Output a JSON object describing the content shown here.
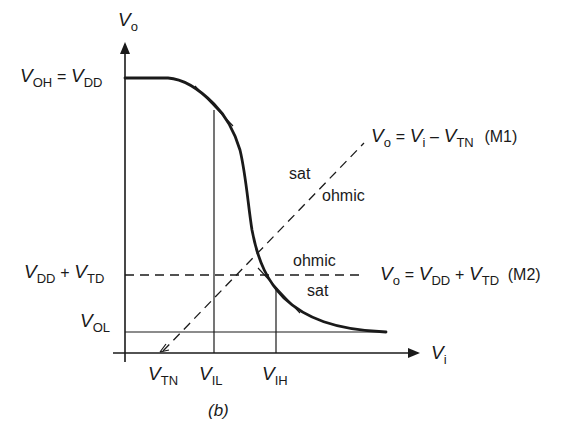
{
  "figure": {
    "caption": "(b)",
    "axes": {
      "y_axis": {
        "symbol": "V",
        "subscript": "o"
      },
      "x_axis": {
        "symbol": "V",
        "subscript": "i"
      }
    },
    "y_labels": {
      "voh": {
        "lhs_symbol": "V",
        "lhs_sub": "OH",
        "eq": "=",
        "rhs_symbol": "V",
        "rhs_sub": "DD"
      },
      "vdd_vtd": {
        "a_symbol": "V",
        "a_sub": "DD",
        "op": "+",
        "b_symbol": "V",
        "b_sub": "TD"
      },
      "vol": {
        "symbol": "V",
        "sub": "OL"
      }
    },
    "x_labels": {
      "vtn": {
        "symbol": "V",
        "sub": "TN"
      },
      "vil": {
        "symbol": "V",
        "sub": "IL"
      },
      "vih": {
        "symbol": "V",
        "sub": "IH"
      }
    },
    "boundary_m1": {
      "lhs_symbol": "V",
      "lhs_sub": "o",
      "eq": "=",
      "a_symbol": "V",
      "a_sub": "i",
      "op": "–",
      "b_symbol": "V",
      "b_sub": "TN",
      "tag": "(M1)",
      "region_above": "sat",
      "region_below": "ohmic"
    },
    "boundary_m2": {
      "lhs_symbol": "V",
      "lhs_sub": "o",
      "eq": "=",
      "a_symbol": "V",
      "a_sub": "DD",
      "op": "+",
      "b_symbol": "V",
      "b_sub": "TD",
      "tag": "(M2)",
      "region_above": "ohmic",
      "region_below": "sat"
    },
    "colors": {
      "ink": "#1a1a1a",
      "background": "#ffffff"
    }
  }
}
